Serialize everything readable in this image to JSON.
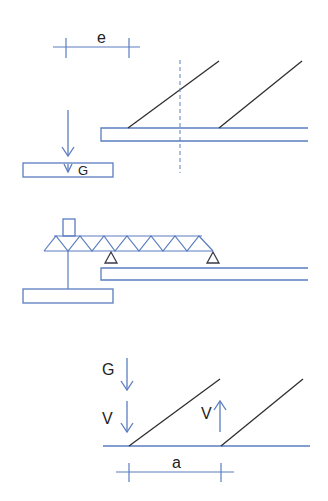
{
  "colors": {
    "structure": "#5a7dc0",
    "diagonal": "#2e2e2e",
    "text": "#222222",
    "background": "#ffffff"
  },
  "panel_top": {
    "dimension_label": "e",
    "load_label": "G"
  },
  "panel_middle": {
    "description": "truss beam on two supports over slab, with post to lower box"
  },
  "panel_bottom": {
    "load_labels": {
      "g": "G",
      "v_down": "V",
      "v_up": "V"
    },
    "dimension_label": "a"
  }
}
